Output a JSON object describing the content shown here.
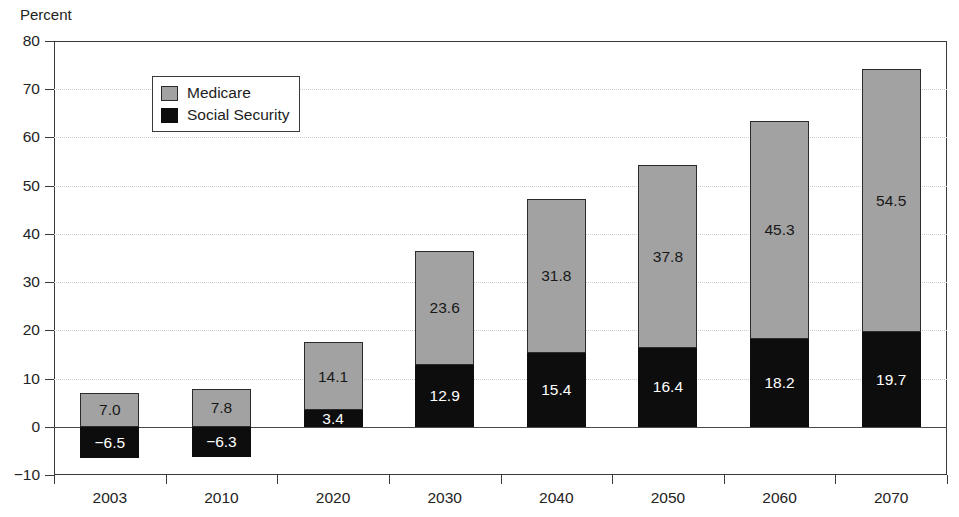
{
  "chart_data": {
    "type": "bar",
    "stacked": true,
    "title": "",
    "xlabel": "",
    "ylabel": "Percent",
    "ylim": [
      -10,
      80
    ],
    "ytick_step": 10,
    "yticks": [
      "80",
      "70",
      "60",
      "50",
      "40",
      "30",
      "20",
      "10",
      "0",
      "-10"
    ],
    "ytick_values": [
      80,
      70,
      60,
      50,
      40,
      30,
      20,
      10,
      0,
      -10
    ],
    "grid": true,
    "grid_axis": "y",
    "legend_position": "upper-left-inside",
    "categories": [
      "2003",
      "2010",
      "2020",
      "2030",
      "2040",
      "2050",
      "2060",
      "2070"
    ],
    "series": [
      {
        "name": "Social Security",
        "color": "#0d0d0d",
        "values": [
          -6.5,
          -6.3,
          3.4,
          12.9,
          15.4,
          16.4,
          18.2,
          19.7
        ],
        "labels": [
          "−6.5",
          "−6.3",
          "3.4",
          "12.9",
          "15.4",
          "16.4",
          "18.2",
          "19.7"
        ]
      },
      {
        "name": "Medicare",
        "color": "#a2a2a2",
        "values": [
          7.0,
          7.8,
          14.1,
          23.6,
          31.8,
          37.8,
          45.3,
          54.5
        ],
        "labels": [
          "7.0",
          "7.8",
          "14.1",
          "23.6",
          "31.8",
          "37.8",
          "45.3",
          "54.5"
        ]
      }
    ]
  },
  "legend": {
    "items": [
      {
        "label": "Medicare",
        "color": "#a2a2a2"
      },
      {
        "label": "Social Security",
        "color": "#0d0d0d"
      }
    ]
  },
  "axes": {
    "y_title": "Percent"
  }
}
